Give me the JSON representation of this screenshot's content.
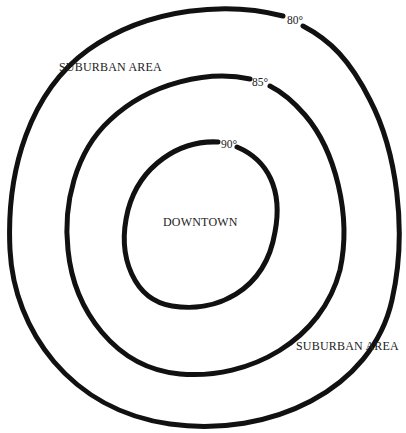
{
  "diagram": {
    "type": "isotherm-map",
    "rings": [
      {
        "id": "outer",
        "label": "80°"
      },
      {
        "id": "middle",
        "label": "85°"
      },
      {
        "id": "inner",
        "label": "90°"
      }
    ],
    "labels": {
      "center": "DOWNTOWN",
      "suburban_top_left": "SUBURBAN AREA",
      "suburban_bottom_right": "SUBURBAN AREA"
    },
    "colors": {
      "line": "#111111",
      "text": "#222222",
      "background": "#ffffff"
    }
  }
}
